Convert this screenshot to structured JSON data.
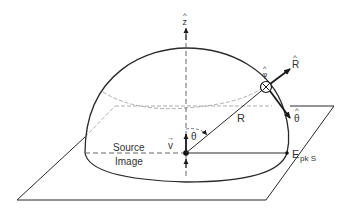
{
  "diagram": {
    "type": "hemisphere-radiation-geometry",
    "colors": {
      "line": "#2a2a2a",
      "dashed": "#888888",
      "text": "#333333",
      "background": "#ffffff"
    },
    "labels": {
      "z_axis": "z",
      "phi_unit": "φ",
      "r_unit": "R",
      "theta_unit": "θ",
      "radius": "R",
      "angle": "θ",
      "velocity": "v",
      "source_line1": "Source",
      "source_line2": "Image",
      "field_main": "E",
      "field_sub": "pk S"
    },
    "hat_glyph": "^",
    "vector_glyph": "→"
  }
}
